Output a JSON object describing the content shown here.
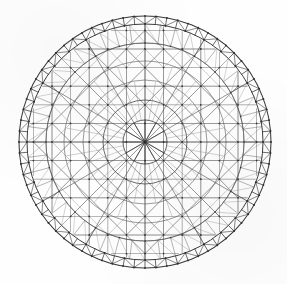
{
  "figure": {
    "type": "technical-line-drawing",
    "caption": "",
    "background_color": "#fefefe",
    "line_color": "#4a4a4a",
    "line_color_dark": "#2e2e2e",
    "line_color_light": "#7d7d7d",
    "node_color": "#2b2b2b",
    "canvas": {
      "width": 287,
      "height": 284
    }
  },
  "geometry": {
    "center_x": 145,
    "center_y": 142,
    "outer_radius": 126,
    "inner_compression_ring_radius": 118,
    "hub_ring_radius": 22,
    "second_ring_radius": 42,
    "ring_radii": [
      22,
      42,
      62,
      81,
      99,
      118,
      126
    ],
    "grid_spacing": 18.6,
    "perimeter_segments": 72,
    "radial_count": 36
  },
  "chart_data": {
    "type": "scatter",
    "xlabel": "",
    "ylabel": "",
    "categories": [
      "outer-compression-ring",
      "inner-compression-ring",
      "perimeter-lacing",
      "concentric-rings",
      "orthogonal-grid",
      "diagonal-bracing",
      "central-hub"
    ],
    "values": [
      1,
      1,
      72,
      5,
      26,
      180,
      1
    ],
    "ring_radii": [
      22,
      42,
      62,
      81,
      99,
      118,
      126
    ],
    "grid_spacing": 18.6,
    "ylim": [
      0,
      200
    ],
    "legend_position": "none",
    "grid": false
  },
  "labels": {
    "none_visible": ""
  }
}
